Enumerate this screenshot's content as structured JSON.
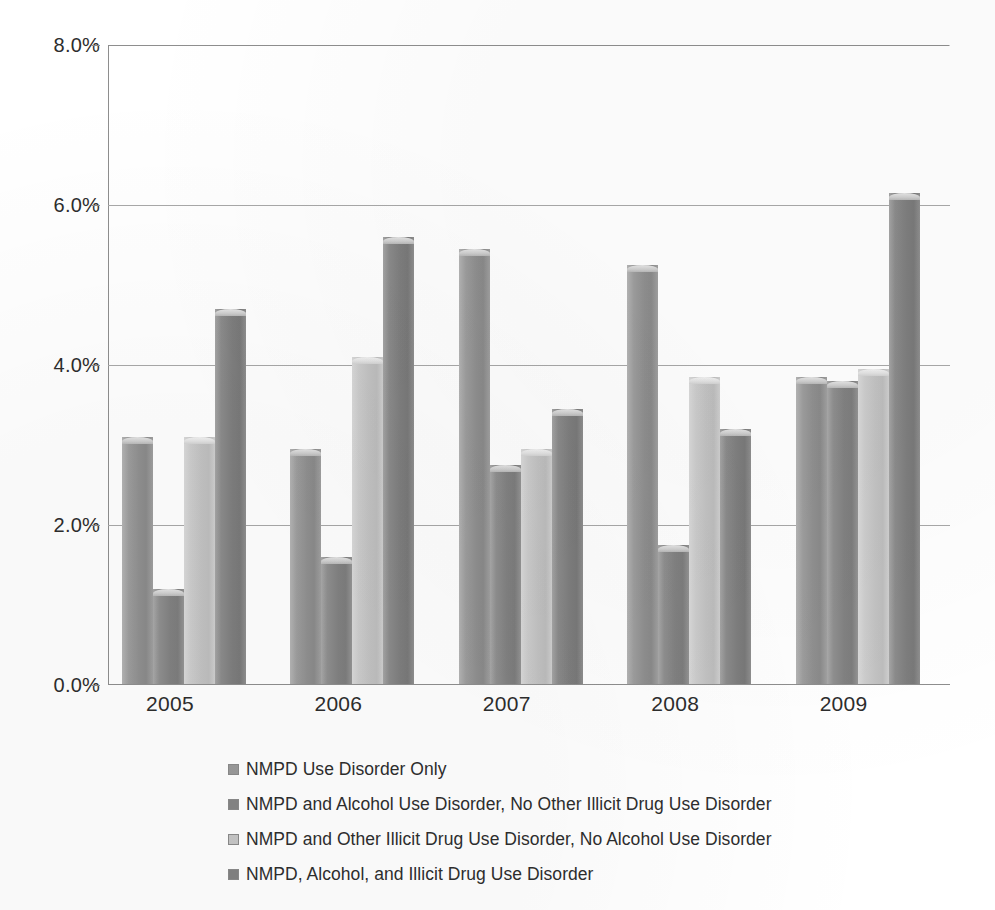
{
  "chart_data": {
    "type": "bar",
    "title": "",
    "subtitle": "",
    "xlabel": "",
    "ylabel": "",
    "categories": [
      "2005",
      "2006",
      "2007",
      "2008",
      "2009"
    ],
    "ylim": [
      0,
      8
    ],
    "yticks": [
      0,
      2,
      4,
      6,
      8
    ],
    "ytick_labels": [
      "0.0%",
      "2.0%",
      "4.0%",
      "6.0%",
      "8.0%"
    ],
    "grid": true,
    "legend_position": "bottom-left",
    "value_unit": "%",
    "series": [
      {
        "name": "NMPD Use Disorder Only",
        "color": "#9a9a9a",
        "values": [
          3.1,
          2.95,
          5.45,
          5.25,
          3.85
        ]
      },
      {
        "name": "NMPD and Alcohol Use Disorder, No Other Illicit Drug Use Disorder",
        "color": "#858585",
        "values": [
          1.2,
          1.6,
          2.75,
          1.75,
          3.8
        ]
      },
      {
        "name": "NMPD and Other Illicit Drug Use Disorder, No Alcohol Use Disorder",
        "color": "#c6c6c6",
        "values": [
          3.1,
          4.1,
          2.95,
          3.85,
          3.95
        ]
      },
      {
        "name": "NMPD, Alcohol, and Illicit Drug Use Disorder",
        "color": "#828282",
        "values": [
          4.7,
          5.6,
          3.45,
          3.2,
          6.15
        ]
      }
    ]
  },
  "axis": {
    "y_labels": [
      "8.0%",
      "6.0%",
      "4.0%",
      "2.0%",
      "0.0%"
    ],
    "x_labels": [
      "2005",
      "2006",
      "2007",
      "2008",
      "2009"
    ]
  },
  "legend": {
    "items": [
      {
        "label": "NMPD Use Disorder Only",
        "color": "#9a9a9a"
      },
      {
        "label": "NMPD and Alcohol Use Disorder, No Other Illicit Drug Use Disorder",
        "color": "#858585"
      },
      {
        "label": "NMPD and Other Illicit Drug Use Disorder, No Alcohol Use Disorder",
        "color": "#c6c6c6"
      },
      {
        "label": "NMPD, Alcohol, and Illicit Drug Use Disorder",
        "color": "#828282"
      }
    ]
  }
}
